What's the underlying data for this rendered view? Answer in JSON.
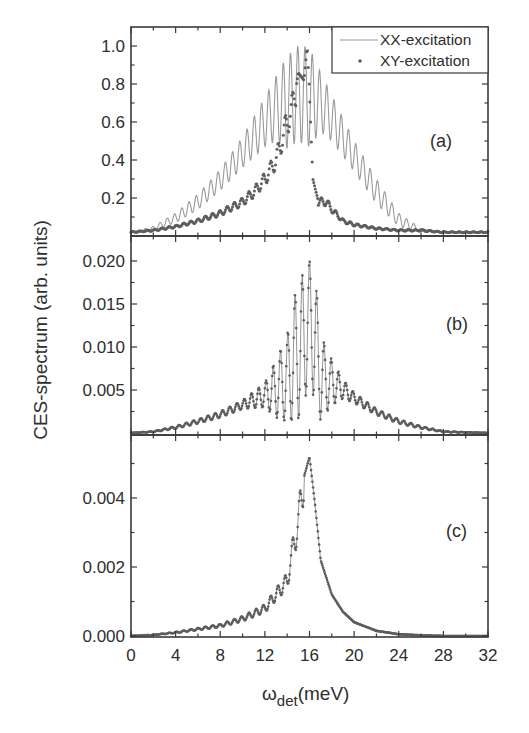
{
  "figure": {
    "ylabel": "CES-spectrum (arb. units)",
    "xlabel_main": "ω",
    "xlabel_sub": "det",
    "xlabel_unit": "(meV)",
    "x_ticks": [
      "0",
      "4",
      "8",
      "12",
      "16",
      "20",
      "24",
      "28",
      "32"
    ],
    "legend": {
      "items": [
        {
          "label": "XX-excitation",
          "marker": "line",
          "color": "#9a9a9a"
        },
        {
          "label": "XY-excitation",
          "marker": "dot",
          "color": "#5e5e5e"
        }
      ]
    },
    "panels": [
      {
        "label": "(a)",
        "y_ticks": [
          "1.0",
          "0.8",
          "0.6",
          "0.4",
          "0.2"
        ]
      },
      {
        "label": "(b)",
        "y_ticks": [
          "0.020",
          "0.015",
          "0.010",
          "0.005"
        ]
      },
      {
        "label": "(c)",
        "y_ticks": [
          "0.004",
          "0.002",
          "0.000"
        ]
      }
    ]
  },
  "chart_data": [
    {
      "type": "line",
      "panel": "(a)",
      "title": "",
      "xlabel": "ω_det (meV)",
      "ylabel": "CES-spectrum (arb. units)",
      "xlim": [
        0,
        32
      ],
      "ylim": [
        0,
        1.08
      ],
      "x_ticks": [
        0,
        4,
        8,
        12,
        16,
        20,
        24,
        28,
        32
      ],
      "y_ticks": [
        0.2,
        0.4,
        0.6,
        0.8,
        1.0
      ],
      "legend_position": "upper right",
      "grid": false,
      "series": [
        {
          "name": "XX-excitation",
          "style": "thin line, light gray",
          "description": "Oscillating spectrum (period ~0.65 meV) with triangular envelope peaking at ~1.0 near 15-16 meV",
          "x": [
            0,
            2,
            4,
            6,
            8,
            10,
            12,
            13,
            14,
            15,
            15.5,
            16,
            17,
            18,
            20,
            22,
            24,
            26,
            28,
            32
          ],
          "envelope_max": [
            0.02,
            0.05,
            0.12,
            0.22,
            0.35,
            0.52,
            0.73,
            0.84,
            0.95,
            1.0,
            1.0,
            0.99,
            0.86,
            0.74,
            0.5,
            0.3,
            0.12,
            0.04,
            0.02,
            0.02
          ],
          "envelope_min": [
            0.02,
            0.03,
            0.07,
            0.14,
            0.24,
            0.36,
            0.47,
            0.5,
            0.46,
            0.5,
            0.48,
            0.47,
            0.55,
            0.5,
            0.34,
            0.17,
            0.05,
            0.02,
            0.02,
            0.02
          ]
        },
        {
          "name": "XY-excitation",
          "style": "dots, dark gray",
          "x": [
            0,
            2,
            4,
            6,
            8,
            10,
            11,
            12,
            13,
            13.5,
            14,
            14.5,
            15,
            15.5,
            15.8,
            16.0,
            16.3,
            16.8,
            17.5,
            18,
            19,
            20,
            22,
            24,
            26,
            28,
            32
          ],
          "values": [
            0.02,
            0.03,
            0.05,
            0.08,
            0.12,
            0.18,
            0.23,
            0.3,
            0.4,
            0.5,
            0.6,
            0.68,
            0.86,
            0.82,
            1.0,
            0.75,
            0.3,
            0.18,
            0.18,
            0.14,
            0.08,
            0.06,
            0.04,
            0.03,
            0.03,
            0.02,
            0.02
          ]
        }
      ]
    },
    {
      "type": "line",
      "panel": "(b)",
      "xlim": [
        0,
        32
      ],
      "ylim": [
        0,
        0.0225
      ],
      "y_ticks": [
        0.005,
        0.01,
        0.015,
        0.02
      ],
      "series": [
        {
          "name": "XX-excitation (b)",
          "style": "dotted line",
          "description": "Symmetric oscillating spectrum centered at 16 meV, peak 0.020",
          "x": [
            0,
            2,
            4,
            6,
            8,
            10,
            12,
            13,
            14,
            15,
            15.5,
            16,
            16.5,
            17,
            18,
            19,
            20,
            22,
            24,
            26,
            28,
            32
          ],
          "envelope_max": [
            0.0,
            0.0002,
            0.0008,
            0.0016,
            0.0025,
            0.0038,
            0.0058,
            0.0085,
            0.0114,
            0.018,
            0.0185,
            0.0201,
            0.0185,
            0.0114,
            0.0085,
            0.0062,
            0.0047,
            0.0028,
            0.0016,
            0.0008,
            0.0002,
            0.0
          ],
          "envelope_min": [
            0.0,
            0.0001,
            0.0005,
            0.0011,
            0.0018,
            0.0028,
            0.003,
            0.0018,
            0.0013,
            0.0015,
            0.003,
            0.007,
            0.003,
            0.0015,
            0.0032,
            0.004,
            0.0035,
            0.0021,
            0.0011,
            0.0005,
            0.0001,
            0.0
          ]
        }
      ]
    },
    {
      "type": "line",
      "panel": "(c)",
      "xlim": [
        0,
        32
      ],
      "ylim": [
        0,
        0.0057
      ],
      "y_ticks": [
        0.0,
        0.002,
        0.004
      ],
      "series": [
        {
          "name": "XY-excitation (c)",
          "style": "dotted line",
          "description": "Asymmetric spectrum with small oscillations on low-energy side, peak ~0.0052 at 16 meV",
          "x": [
            0,
            2,
            4,
            6,
            8,
            10,
            12,
            13,
            14,
            14.5,
            15,
            15.5,
            16,
            16.5,
            17,
            18,
            19,
            20,
            22,
            24,
            26,
            28,
            32
          ],
          "values": [
            0.0,
            3e-05,
            0.0001,
            0.0002,
            0.0003,
            0.0005,
            0.0008,
            0.0012,
            0.0016,
            0.0025,
            0.0033,
            0.0046,
            0.0052,
            0.0038,
            0.0022,
            0.0012,
            0.0007,
            0.0004,
            0.00015,
            5e-05,
            2e-05,
            0.0,
            0.0
          ]
        }
      ]
    }
  ]
}
